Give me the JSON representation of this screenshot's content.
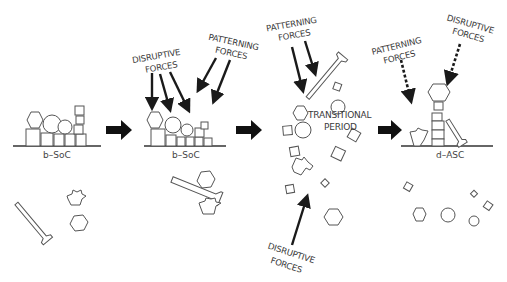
{
  "stages": [
    {
      "id": "stage-1",
      "caption": "b–SoC"
    },
    {
      "id": "stage-2",
      "caption": "b–SoC"
    },
    {
      "id": "stage-3",
      "caption": "TRANSITIONAL\nPERIOD"
    },
    {
      "id": "stage-4",
      "caption": "d–ASC"
    }
  ],
  "labels": {
    "stage2_disruptive_l1": "DISRUPTIVE",
    "stage2_disruptive_l2": "FORCES",
    "stage2_patterning_l1": "PATTERNING",
    "stage2_patterning_l2": "FORCES",
    "stage3_patterning_l1": "PATTERNING",
    "stage3_patterning_l2": "FORCES",
    "stage3_transitional_l1": "TRANSITIONAL",
    "stage3_transitional_l2": "PERIOD",
    "stage3_disruptive_l1": "DISRUPTIVE",
    "stage3_disruptive_l2": "FORCES",
    "stage4_patterning_l1": "PATTERNING",
    "stage4_patterning_l2": "FORCES",
    "stage4_disruptive_l1": "DISRUPTIVE",
    "stage4_disruptive_l2": "FORCES",
    "caption_1": "b–SoC",
    "caption_2": "b–SoC",
    "caption_4": "d–ASC"
  },
  "colors": {
    "outline": "#555555",
    "arrows": "#111111",
    "text": "#3a3a3a",
    "background": "#ffffff"
  },
  "icons": [
    "hexagon",
    "circle",
    "square",
    "diamond",
    "bone-tool",
    "flower-pot"
  ]
}
